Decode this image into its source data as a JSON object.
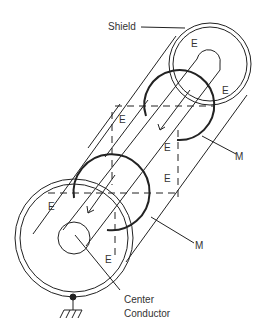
{
  "labels": {
    "shield": "Shield",
    "magnetic_1": "M",
    "magnetic_2": "M",
    "center_conductor_line1": "Center",
    "center_conductor_line2": "Conductor"
  },
  "electric_field_labels": [
    "E",
    "E",
    "E",
    "E",
    "E",
    "E",
    "E"
  ],
  "colors": {
    "line": "#222222",
    "text": "#333333",
    "background": "#ffffff"
  }
}
